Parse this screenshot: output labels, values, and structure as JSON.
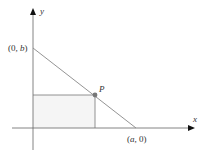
{
  "diagram": {
    "type": "coordinate-geometry",
    "axes": {
      "x_label": "x",
      "y_label": "y"
    },
    "points": {
      "y_intercept": {
        "label_open": "(0, ",
        "label_var": "b",
        "label_close": ")"
      },
      "x_intercept": {
        "label_open": "(",
        "label_var": "a",
        "label_close": ", 0)"
      },
      "p": {
        "label": "P"
      }
    },
    "colors": {
      "axes": "#555555",
      "line": "#888888",
      "rect": "#777777",
      "point": "#777777",
      "rect_fill": "#f4f4f4"
    }
  }
}
